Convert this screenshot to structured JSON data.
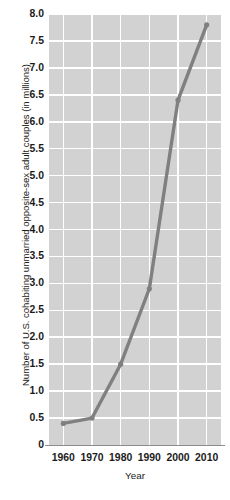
{
  "chart_data": {
    "type": "line",
    "title": "",
    "xlabel": "Year",
    "ylabel": "Number of U.S. cohabiting unmarried opposite-sex adult couples (in millions)",
    "x": [
      1960,
      1970,
      1980,
      1990,
      2000,
      2010
    ],
    "values": [
      0.4,
      0.5,
      1.5,
      2.9,
      6.4,
      7.8
    ],
    "x_tick_labels": [
      "1960",
      "1970",
      "1980",
      "1990",
      "2000",
      "2010"
    ],
    "y_tick_labels": [
      "8.0",
      "7.5",
      "7.0",
      "6.5",
      "6.0",
      "5.5",
      "5.0",
      "4.5",
      "4.0",
      "3.5",
      "3.0",
      "2.5",
      "2.0",
      "1.5",
      "1.0",
      "0.5",
      "0"
    ],
    "y_tick_values": [
      8.0,
      7.5,
      7.0,
      6.5,
      6.0,
      5.5,
      5.0,
      4.5,
      4.0,
      3.5,
      3.0,
      2.5,
      2.0,
      1.5,
      1.0,
      0.5,
      0
    ],
    "xlim": [
      1955,
      2015
    ],
    "ylim": [
      0,
      8.0
    ],
    "grid": true,
    "legend": "none",
    "series_color": "#808080",
    "plot_background": "#d2d2d2",
    "gridline_color": "#ffffff",
    "axis_text_color": "#1b1b1b"
  }
}
